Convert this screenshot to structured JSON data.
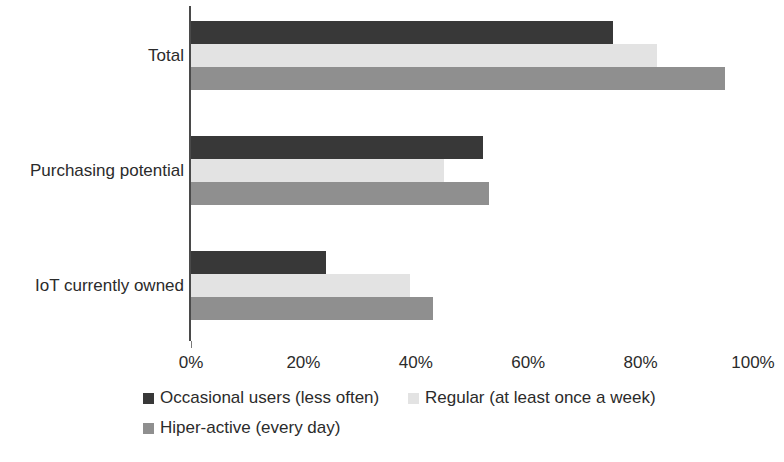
{
  "chart_data": {
    "type": "bar",
    "orientation": "horizontal",
    "title": "",
    "xlabel": "",
    "ylabel": "",
    "xlim": [
      0,
      100
    ],
    "grid": false,
    "legend_position": "bottom",
    "tick_labels": [
      "0%",
      "20%",
      "40%",
      "60%",
      "80%",
      "100%"
    ],
    "tick_values": [
      0,
      20,
      40,
      60,
      80,
      100
    ],
    "categories": [
      "Total",
      "Purchasing potential",
      "IoT currently owned"
    ],
    "series": [
      {
        "name": "Occasional users (less often)",
        "color": "#383838",
        "values": [
          75,
          52,
          24
        ]
      },
      {
        "name": "Regular (at least once a week)",
        "color": "#e3e3e3",
        "values": [
          83,
          45,
          39
        ]
      },
      {
        "name": "Hiper-active (every day)",
        "color": "#8f8f8f",
        "values": [
          95,
          53,
          43
        ]
      }
    ]
  }
}
